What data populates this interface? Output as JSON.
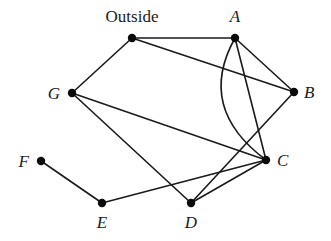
{
  "diagram": {
    "type": "graph",
    "nodes": [
      {
        "id": "Outside",
        "label": "Outside",
        "x": 132,
        "y": 38,
        "lx": 132,
        "ly": 22,
        "anchor": "middle",
        "italic": false
      },
      {
        "id": "A",
        "label": "A",
        "x": 235,
        "y": 38,
        "lx": 235,
        "ly": 22,
        "anchor": "middle",
        "italic": true
      },
      {
        "id": "B",
        "label": "B",
        "x": 294,
        "y": 92,
        "lx": 304,
        "ly": 98,
        "anchor": "start",
        "italic": true
      },
      {
        "id": "C",
        "label": "C",
        "x": 266,
        "y": 160,
        "lx": 277,
        "ly": 166,
        "anchor": "start",
        "italic": true
      },
      {
        "id": "D",
        "label": "D",
        "x": 191,
        "y": 203,
        "lx": 191,
        "ly": 228,
        "anchor": "middle",
        "italic": true
      },
      {
        "id": "E",
        "label": "E",
        "x": 102,
        "y": 203,
        "lx": 102,
        "ly": 228,
        "anchor": "middle",
        "italic": true
      },
      {
        "id": "F",
        "label": "F",
        "x": 41,
        "y": 161,
        "lx": 29,
        "ly": 167,
        "anchor": "end",
        "italic": true
      },
      {
        "id": "G",
        "label": "G",
        "x": 72,
        "y": 93,
        "lx": 60,
        "ly": 99,
        "anchor": "end",
        "italic": true
      }
    ],
    "edges": [
      {
        "from": "Outside",
        "to": "A"
      },
      {
        "from": "Outside",
        "to": "B"
      },
      {
        "from": "Outside",
        "to": "G"
      },
      {
        "from": "A",
        "to": "B"
      },
      {
        "from": "A",
        "to": "C"
      },
      {
        "from": "A",
        "to": "C",
        "curved": true,
        "cx": 196,
        "cy": 108
      },
      {
        "from": "B",
        "to": "D"
      },
      {
        "from": "G",
        "to": "C"
      },
      {
        "from": "G",
        "to": "D"
      },
      {
        "from": "C",
        "to": "D"
      },
      {
        "from": "C",
        "to": "E"
      },
      {
        "from": "E",
        "to": "F"
      }
    ]
  }
}
